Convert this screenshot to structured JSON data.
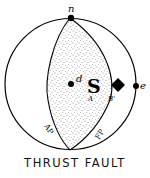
{
  "diagram": {
    "title": "THRUST FAULT",
    "labels": {
      "north": "n",
      "east": "e",
      "d": "d",
      "slip": "S",
      "a": "A",
      "b": "B'",
      "auxiliary_plane": "AP",
      "fault_plane": "FP"
    },
    "colors": {
      "ink": "#000000",
      "background": "#ffffff",
      "stipple": "#333333"
    }
  }
}
